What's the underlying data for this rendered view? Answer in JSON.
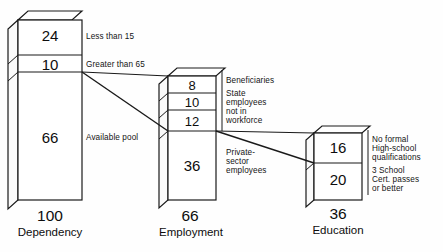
{
  "diagram": {
    "bars": [
      {
        "id": "dependency",
        "total": "100",
        "category": "Dependency",
        "segments": [
          {
            "value": "24",
            "label": "Less than 15"
          },
          {
            "value": "10",
            "label": "Greater than 65"
          },
          {
            "value": "66",
            "label": "Available pool"
          }
        ]
      },
      {
        "id": "employment",
        "total": "66",
        "category": "Employment",
        "segments": [
          {
            "value": "8",
            "label": "Beneficiaries"
          },
          {
            "value": "10",
            "label": "State\nemployees\nnot in\nworkforce"
          },
          {
            "value": "12",
            "label": ""
          },
          {
            "value": "36",
            "label": "Private-\nsector\nemployees"
          }
        ]
      },
      {
        "id": "education",
        "total": "36",
        "category": "Education",
        "segments": [
          {
            "value": "16",
            "label": "No formal\nHigh-school\nqualifications"
          },
          {
            "value": "20",
            "label": "3 School\nCert. passes\nor better"
          }
        ]
      }
    ],
    "labels": {
      "less_than_15": "Less than 15",
      "greater_than_65": "Greater than 65",
      "available_pool": "Available pool",
      "beneficiaries": "Beneficiaries",
      "state_employees_1": "State",
      "state_employees_2": "employees",
      "state_employees_3": "not in",
      "state_employees_4": "workforce",
      "private_1": "Private-",
      "private_2": "sector",
      "private_3": "employees",
      "edu_a_1": "No formal",
      "edu_a_2": "High-school",
      "edu_a_3": "qualifications",
      "edu_b_1": "3 School",
      "edu_b_2": "Cert. passes",
      "edu_b_3": "or better"
    },
    "values": {
      "v24": "24",
      "v10a": "10",
      "v66a": "66",
      "v100": "100",
      "dependency": "Dependency",
      "v8": "8",
      "v10b": "10",
      "v12": "12",
      "v36a": "36",
      "v66b": "66",
      "employment": "Employment",
      "v16": "16",
      "v20": "20",
      "v36b": "36",
      "education": "Education"
    },
    "colors": {
      "stroke": "#1a1a1a",
      "face": "#ffffff",
      "side": "#f7f7f7",
      "background": "#fefefe"
    }
  }
}
